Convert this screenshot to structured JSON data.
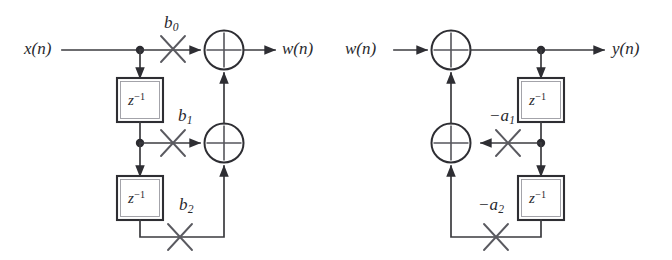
{
  "figure": {
    "background_color": "#ffffff",
    "line_color": "#3b3b3f",
    "width": 672,
    "height": 260
  },
  "sections": {
    "feedforward": {
      "name": "feedforward-section",
      "input_label": "x(n)",
      "output_label": "w(n)",
      "coefficients": [
        {
          "id": "b0",
          "label": "b",
          "subscript": "0"
        },
        {
          "id": "b1",
          "label": "b",
          "subscript": "1"
        },
        {
          "id": "b2",
          "label": "b",
          "subscript": "2"
        }
      ],
      "delays": [
        {
          "id": "ff-delay-1",
          "label": "z",
          "exponent": "-1"
        },
        {
          "id": "ff-delay-2",
          "label": "z",
          "exponent": "-1"
        }
      ],
      "adders": [
        {
          "id": "ff-adder-top",
          "symbol": "+"
        },
        {
          "id": "ff-adder-mid",
          "symbol": "+"
        }
      ]
    },
    "feedback": {
      "name": "feedback-section",
      "input_label": "w(n)",
      "output_label": "y(n)",
      "coefficients": [
        {
          "id": "a1",
          "label": "−a",
          "subscript": "1"
        },
        {
          "id": "a2",
          "label": "−a",
          "subscript": "2"
        }
      ],
      "delays": [
        {
          "id": "fb-delay-1",
          "label": "z",
          "exponent": "-1"
        },
        {
          "id": "fb-delay-2",
          "label": "z",
          "exponent": "-1"
        }
      ],
      "adders": [
        {
          "id": "fb-adder-top",
          "symbol": "+"
        },
        {
          "id": "fb-adder-mid",
          "symbol": "+"
        }
      ]
    }
  },
  "labels": {
    "x_of_n": "x(n)",
    "w_of_n_out": "w(n)",
    "w_of_n_in": "w(n)",
    "y_of_n": "y(n)",
    "b0_base": "b",
    "b0_sub": "0",
    "b1_base": "b",
    "b1_sub": "1",
    "b2_base": "b",
    "b2_sub": "2",
    "a1_base": "−a",
    "a1_sub": "1",
    "a2_base": "−a",
    "a2_sub": "2",
    "z_base": "z",
    "z_sup": "−1"
  }
}
